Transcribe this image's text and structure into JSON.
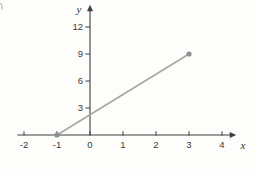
{
  "figure": {
    "background": "#fdfdfb"
  },
  "chart_data": {
    "type": "line",
    "title": "",
    "xlabel": "x",
    "ylabel": "y",
    "x_ticks": [
      -2,
      -1,
      0,
      1,
      2,
      3,
      4
    ],
    "y_ticks": [
      3,
      6,
      9,
      12
    ],
    "xlim": [
      -2.2,
      4.25
    ],
    "ylim": [
      0,
      13.8
    ],
    "grid": false,
    "legend": false,
    "series": [
      {
        "name": "line-segment",
        "points": [
          [
            -1,
            0
          ],
          [
            3,
            9
          ]
        ],
        "marker": "circle",
        "line_color": "#a5a5a2",
        "marker_color": "#8e8e8e"
      }
    ],
    "axis_color": "#3f3f3f",
    "tick_label_color": "#3a3a3a"
  }
}
